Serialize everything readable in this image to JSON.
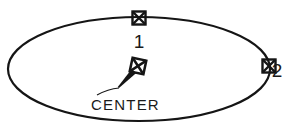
{
  "drawing": {
    "title": "Ellipse with center and axis point markers",
    "background_color": "#ffffff",
    "line_color": "#151515",
    "text_color": "#1a1a1a",
    "ellipse": {
      "center_x": 139,
      "center_y": 69,
      "radius_x": 131,
      "radius_y": 52,
      "stroke_width": 2.2
    },
    "markers": [
      {
        "id": "point-1",
        "name": "axis-endpoint-marker-1",
        "x": 139,
        "y": 18,
        "size": 13,
        "rotation": 0,
        "glyph": "x-in-square"
      },
      {
        "id": "point-2",
        "name": "axis-endpoint-marker-2",
        "x": 269,
        "y": 66,
        "size": 13,
        "rotation": 0,
        "glyph": "x-in-square"
      },
      {
        "id": "center-point",
        "name": "center-marker",
        "x": 138,
        "y": 66,
        "size": 14,
        "rotation": 12,
        "glyph": "x-in-square"
      }
    ],
    "leader": {
      "arrow_tip_x": 134,
      "arrow_tip_y": 71,
      "arrow_tail_x": 119,
      "arrow_tail_y": 88,
      "shoulder_x": 97,
      "shoulder_y": 95,
      "arrow_width": 6
    },
    "labels": [
      {
        "id": "label-1",
        "text": "1",
        "x": 139,
        "y": 48,
        "anchor": "middle",
        "style": "num"
      },
      {
        "id": "label-2",
        "text": "2",
        "x": 277,
        "y": 77,
        "anchor": "middle",
        "style": "num"
      },
      {
        "id": "label-center",
        "text": "CENTER",
        "x": 91,
        "y": 110,
        "anchor": "start",
        "style": "center"
      }
    ]
  }
}
